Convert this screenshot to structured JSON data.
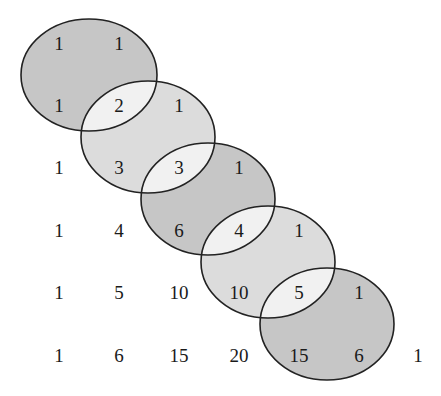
{
  "diagram": {
    "title": "",
    "colors": {
      "background": "#ffffff",
      "ellipse_dark": "#c6c6c6",
      "ellipse_light": "#dcdcdc",
      "intersection": "#f1f1f1",
      "stroke": "#222222",
      "text": "#1a1a1a"
    },
    "columns_x": [
      59,
      119,
      179,
      239,
      299,
      359,
      418
    ],
    "rows_y": [
      43,
      105,
      167,
      230,
      292,
      355
    ],
    "rows": [
      [
        "1",
        "1"
      ],
      [
        "1",
        "2",
        "1"
      ],
      [
        "1",
        "3",
        "3",
        "1"
      ],
      [
        "1",
        "4",
        "6",
        "4",
        "1"
      ],
      [
        "1",
        "5",
        "10",
        "10",
        "5",
        "1"
      ],
      [
        "1",
        "6",
        "15",
        "20",
        "15",
        "6",
        "1"
      ]
    ],
    "ellipses": [
      {
        "cx": 89,
        "cy": 75,
        "rx": 68,
        "ry": 56,
        "shade": "dark",
        "contains": [
          "1",
          "1",
          "1",
          "2"
        ]
      },
      {
        "cx": 148,
        "cy": 137,
        "rx": 67,
        "ry": 56,
        "shade": "light",
        "contains": [
          "2",
          "1",
          "3",
          "3"
        ]
      },
      {
        "cx": 208,
        "cy": 199,
        "rx": 67,
        "ry": 56,
        "shade": "dark",
        "contains": [
          "3",
          "1",
          "6",
          "4"
        ]
      },
      {
        "cx": 268,
        "cy": 262,
        "rx": 67,
        "ry": 56,
        "shade": "light",
        "contains": [
          "4",
          "1",
          "10",
          "5"
        ]
      },
      {
        "cx": 327,
        "cy": 324,
        "rx": 67,
        "ry": 56,
        "shade": "dark",
        "contains": [
          "5",
          "1",
          "15",
          "6"
        ]
      }
    ]
  }
}
